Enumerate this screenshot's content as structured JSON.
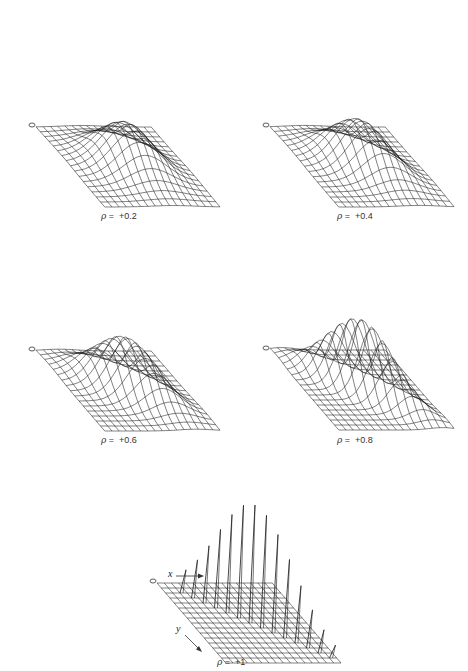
{
  "chart_data": [
    {
      "type": "surface3d",
      "title": "",
      "caption_symbol": "ρ",
      "caption_value": "+0.2",
      "rho": 0.2,
      "origin_label": "0",
      "grid": "wireframe",
      "description": "Bivariate normal-like wireframe surface; broad ridge along diagonal with single dominant peak"
    },
    {
      "type": "surface3d",
      "caption_symbol": "ρ",
      "caption_value": "+0.4",
      "rho": 0.4,
      "origin_label": "0",
      "grid": "wireframe",
      "description": "Wireframe surface; ridge narrows toward diagonal, peaks split slightly"
    },
    {
      "type": "surface3d",
      "caption_symbol": "ρ",
      "caption_value": "+0.6",
      "rho": 0.6,
      "origin_label": "0",
      "grid": "wireframe",
      "description": "Wireframe surface; several sharper peaks along the diagonal"
    },
    {
      "type": "surface3d",
      "caption_symbol": "ρ",
      "caption_value": "+0.8",
      "rho": 0.8,
      "origin_label": "0",
      "grid": "wireframe",
      "description": "Wireframe surface; multiple narrow spikes along the diagonal"
    },
    {
      "type": "surface3d",
      "caption_symbol": "ρ",
      "caption_value": "+1",
      "rho": 1,
      "origin_label": "0",
      "x_axis_label": "x",
      "y_axis_label": "y",
      "grid": "wireframe",
      "description": "Degenerate case; distinct needle spikes along the diagonal of the grid"
    }
  ],
  "panels": [
    {
      "caption_eq": "=",
      "caption_value": "+0.2"
    },
    {
      "caption_eq": "=",
      "caption_value": "+0.4"
    },
    {
      "caption_eq": "=",
      "caption_value": "+0.6"
    },
    {
      "caption_eq": "=",
      "caption_value": "+0.8"
    },
    {
      "caption_eq": "=",
      "caption_value": "+1"
    }
  ],
  "symbols": {
    "rho": "ρ",
    "origin": "0",
    "x": "x",
    "y": "y"
  }
}
